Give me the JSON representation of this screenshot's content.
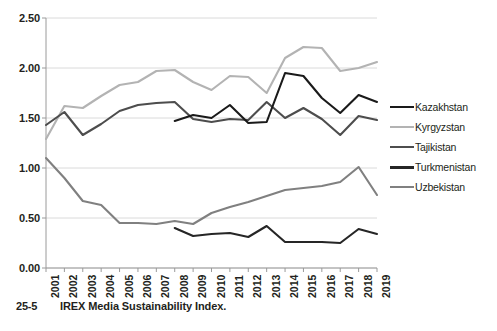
{
  "caption": {
    "number": "25-5",
    "text": "IREX Media Sustainability Index."
  },
  "legend": {
    "position": "right",
    "items": [
      {
        "label": "Kazakhstan",
        "color": "#1a1a1a"
      },
      {
        "label": "Kyrgyzstan",
        "color": "#b3b3b3"
      },
      {
        "label": "Tajikistan",
        "color": "#4d4d4d"
      },
      {
        "label": "Turkmenistan",
        "color": "#262626"
      },
      {
        "label": "Uzbekistan",
        "color": "#808080"
      }
    ]
  },
  "chart_data": {
    "type": "line",
    "title": "",
    "xlabel": "",
    "ylabel": "",
    "grid": true,
    "legend_position": "right",
    "ylim": [
      0.0,
      2.5
    ],
    "ytick_labels": [
      "0.00",
      "0.50",
      "1.00",
      "1.50",
      "2.00",
      "2.50"
    ],
    "ytick_values": [
      0.0,
      0.5,
      1.0,
      1.5,
      2.0,
      2.5
    ],
    "categories": [
      "2001",
      "2002",
      "2003",
      "2004",
      "2005",
      "2006",
      "2007",
      "2008",
      "2009",
      "2010",
      "2011",
      "2012",
      "2013",
      "2014",
      "2015",
      "2016",
      "2017",
      "2018",
      "2019"
    ],
    "series": [
      {
        "name": "Kazakhstan",
        "color": "#1a1a1a",
        "values": [
          null,
          null,
          null,
          null,
          null,
          null,
          null,
          1.47,
          1.53,
          1.5,
          1.63,
          1.45,
          1.46,
          1.95,
          1.92,
          1.7,
          1.55,
          1.73,
          1.66
        ]
      },
      {
        "name": "Kyrgyzstan",
        "color": "#b3b3b3",
        "values": [
          1.29,
          1.62,
          1.6,
          1.72,
          1.83,
          1.86,
          1.97,
          1.98,
          1.86,
          1.78,
          1.92,
          1.91,
          1.75,
          2.1,
          2.21,
          2.2,
          1.97,
          2.0,
          2.06
        ]
      },
      {
        "name": "Tajikistan",
        "color": "#4d4d4d",
        "values": [
          1.43,
          1.56,
          1.33,
          1.44,
          1.57,
          1.63,
          1.65,
          1.66,
          1.49,
          1.46,
          1.49,
          1.48,
          1.66,
          1.5,
          1.6,
          1.49,
          1.33,
          1.52,
          1.48
        ]
      },
      {
        "name": "Turkmenistan",
        "color": "#262626",
        "values": [
          null,
          null,
          null,
          null,
          null,
          null,
          null,
          0.4,
          0.32,
          0.34,
          0.35,
          0.31,
          0.42,
          0.26,
          0.26,
          0.26,
          0.25,
          0.39,
          0.34
        ]
      },
      {
        "name": "Uzbekistan",
        "color": "#808080",
        "values": [
          1.1,
          0.9,
          0.67,
          0.63,
          0.45,
          0.45,
          0.44,
          0.47,
          0.44,
          0.55,
          0.61,
          0.66,
          0.72,
          0.78,
          0.8,
          0.82,
          0.86,
          1.01,
          0.73
        ]
      }
    ]
  }
}
